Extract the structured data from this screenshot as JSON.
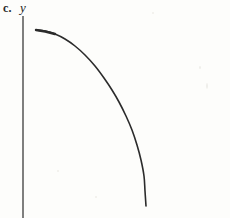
{
  "figure": {
    "part_label": "c.",
    "background_color": "#fdfdfb",
    "ink_color": "#2b2b2b",
    "width": 230,
    "height": 218
  },
  "axes": {
    "y_axis_label": "y",
    "y_axis_label_style": "italic",
    "y_axis_color": "#555555",
    "y_axis_x": 23,
    "y_axis_top": 16,
    "y_axis_bottom": 218
  },
  "chart_data": {
    "type": "line",
    "title": "c.",
    "xlabel": "",
    "ylabel": "y",
    "grid": false,
    "legend": null,
    "axis_style": "y-axis only, no x-axis drawn, no tick marks, no tick labels",
    "curve_description": "single smooth decreasing concave-down curve resembling a quarter ellipse; starts nearly horizontal at upper left and ends nearly vertical at lower right",
    "series": [
      {
        "name": "curve",
        "stroke_color": "#2b2b2b",
        "stroke_width": 1.6,
        "points": [
          [
            36,
            30
          ],
          [
            45,
            31
          ],
          [
            55,
            34
          ],
          [
            65,
            39
          ],
          [
            75,
            46
          ],
          [
            85,
            55
          ],
          [
            95,
            66
          ],
          [
            104,
            78
          ],
          [
            112,
            90
          ],
          [
            119,
            102
          ],
          [
            126,
            116
          ],
          [
            132,
            130
          ],
          [
            137,
            145
          ],
          [
            141,
            160
          ],
          [
            144,
            176
          ],
          [
            145,
            191
          ],
          [
            146,
            206
          ]
        ]
      }
    ],
    "xlim": [
      23,
      230
    ],
    "ylim": [
      218,
      0
    ]
  }
}
